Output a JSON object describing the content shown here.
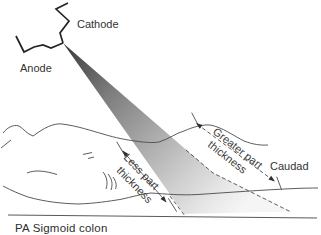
{
  "figure": {
    "caption": "PA Sigmoid colon",
    "tube": {
      "cathode_label": "Cathode",
      "anode_label": "Anode"
    },
    "annotations": {
      "greater_thickness_line1": "Greater part",
      "greater_thickness_line2": "thickness",
      "less_thickness_line1": "Less part",
      "less_thickness_line2": "thickness",
      "caudad_label": "Caudad"
    },
    "colors": {
      "beam_start": "#3a3a3a",
      "beam_mid": "#a8a8a8",
      "beam_end": "#f5f5f5",
      "outline": "#4a4a4a",
      "text": "#333333",
      "background": "#ffffff"
    }
  }
}
